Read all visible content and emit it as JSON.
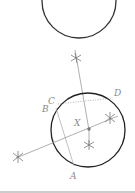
{
  "diagram": {
    "labels": {
      "A": "A",
      "B": "B",
      "C": "C",
      "D": "D",
      "X": "X"
    },
    "colors": {
      "circle": "#333333",
      "construction_line": "#9a9a9a",
      "dotted_chord": "#a0a0a0",
      "label": "#8a8a8a",
      "rule": "#9a9a9a"
    }
  }
}
